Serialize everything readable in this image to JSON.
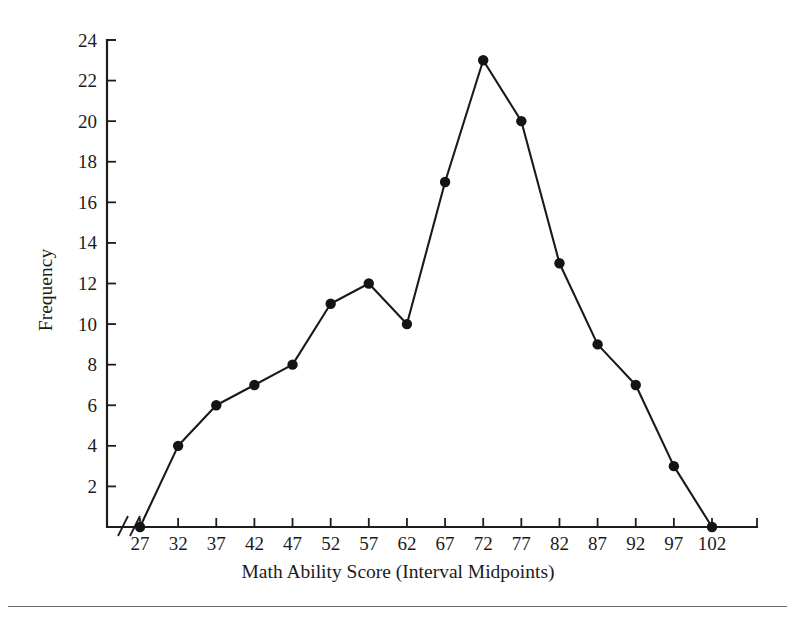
{
  "figure": {
    "background_color": "#ffffff",
    "line_color": "#1a1a1a",
    "marker_color": "#141414",
    "axis_color": "#1d1d1d",
    "y_axis_label": "Frequency",
    "x_axis_label": "Math Ability Score (Interval Midpoints)",
    "y_tick_labels": [
      "2",
      "4",
      "6",
      "8",
      "10",
      "12",
      "14",
      "16",
      "18",
      "20",
      "22",
      "24"
    ],
    "x_tick_labels": [
      "27",
      "32",
      "37",
      "42",
      "47",
      "52",
      "57",
      "62",
      "67",
      "72",
      "77",
      "82",
      "87",
      "92",
      "97",
      "102"
    ],
    "axis_break_symbol": "//"
  },
  "chart_data": {
    "type": "line",
    "title": "",
    "subtitle": "",
    "xlabel": "Math Ability Score (Interval Midpoints)",
    "ylabel": "Frequency",
    "x": [
      27,
      32,
      37,
      42,
      47,
      52,
      57,
      62,
      67,
      72,
      77,
      82,
      87,
      92,
      97,
      102
    ],
    "categories": [
      "27",
      "32",
      "37",
      "42",
      "47",
      "52",
      "57",
      "62",
      "67",
      "72",
      "77",
      "82",
      "87",
      "92",
      "97",
      "102"
    ],
    "values": [
      0,
      4,
      6,
      7,
      8,
      11,
      12,
      10,
      17,
      23,
      20,
      13,
      9,
      7,
      3,
      0
    ],
    "series": [
      {
        "name": "Frequency",
        "values": [
          0,
          4,
          6,
          7,
          8,
          11,
          12,
          10,
          17,
          23,
          20,
          13,
          9,
          7,
          3,
          0
        ]
      }
    ],
    "xlim": [
      27,
      102
    ],
    "ylim": [
      0,
      24
    ],
    "y_ticks": [
      2,
      4,
      6,
      8,
      10,
      12,
      14,
      16,
      18,
      20,
      22,
      24
    ],
    "x_ticks": [
      27,
      32,
      37,
      42,
      47,
      52,
      57,
      62,
      67,
      72,
      77,
      82,
      87,
      92,
      97,
      102
    ],
    "grid": false,
    "legend": false,
    "legend_position": "none",
    "markers": true,
    "marker_style": "filled-circle",
    "x_axis_break": true,
    "annotations": []
  }
}
